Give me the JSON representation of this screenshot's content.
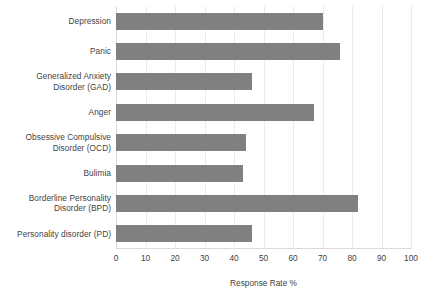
{
  "chart_data": {
    "type": "bar",
    "orientation": "horizontal",
    "title": "",
    "xlabel": "Response Rate %",
    "ylabel": "",
    "xlim": [
      0,
      100
    ],
    "xticks": [
      0,
      10,
      20,
      30,
      40,
      50,
      60,
      70,
      80,
      90,
      100
    ],
    "grid": true,
    "legend": false,
    "bar_color": "#808080",
    "gridline_color": "#eceaea",
    "categories": [
      "Depression",
      "Panic",
      "Generalized Anxiety Disorder (GAD)",
      "Anger",
      "Obsessive Compulsive Disorder (OCD)",
      "Bulimia",
      "Borderline Personality Disorder (BPD)",
      "Personality disorder (PD)"
    ],
    "category_label_lines": [
      [
        "Depression"
      ],
      [
        "Panic"
      ],
      [
        "Generalized Anxiety",
        "Disorder (GAD)"
      ],
      [
        "Anger"
      ],
      [
        "Obsessive Compulsive",
        "Disorder (OCD)"
      ],
      [
        "Bulimia"
      ],
      [
        "Borderline Personality",
        "Disorder (BPD)"
      ],
      [
        "Personality disorder (PD)"
      ]
    ],
    "values": [
      70,
      76,
      46,
      67,
      44,
      43,
      82,
      46
    ]
  }
}
